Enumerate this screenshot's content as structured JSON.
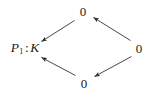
{
  "figure": {
    "kind": "commutative-diagram",
    "shape": "diamond",
    "background_color": "#ffffff",
    "line_color": "#333333",
    "text_color": "#1b1b1b",
    "width": 148,
    "height": 96
  },
  "nodes": {
    "left": {
      "id": "node-left",
      "label": "P₁ : K",
      "symbol": "P",
      "subscript": "1",
      "separator": ":",
      "ring": "K",
      "x": 25,
      "y": 49
    },
    "top": {
      "id": "node-top",
      "label": "0",
      "x": 83,
      "y": 11
    },
    "right": {
      "id": "node-right",
      "label": "0",
      "x": 139,
      "y": 48
    },
    "bottom": {
      "id": "node-bottom",
      "label": "0",
      "x": 84,
      "y": 83
    }
  },
  "edges": [
    {
      "id": "edge-top-to-left",
      "from": "top",
      "to": "left",
      "direction": "down-left",
      "arrowhead": "end",
      "label": ""
    },
    {
      "id": "edge-right-to-top",
      "from": "right",
      "to": "top",
      "direction": "up-left",
      "arrowhead": "end",
      "label": ""
    },
    {
      "id": "edge-bottom-to-left",
      "from": "bottom",
      "to": "left",
      "direction": "up-left",
      "arrowhead": "end",
      "label": ""
    },
    {
      "id": "edge-right-to-bottom",
      "from": "right",
      "to": "bottom",
      "direction": "down-left",
      "arrowhead": "end",
      "label": ""
    }
  ]
}
